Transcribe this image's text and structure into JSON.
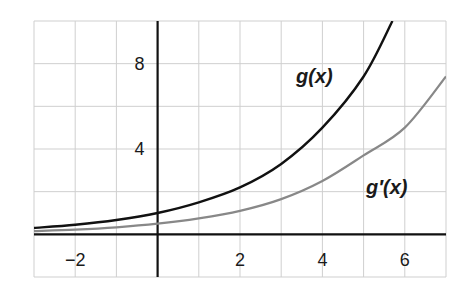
{
  "chart_data": {
    "type": "line",
    "title": "",
    "xlabel": "",
    "ylabel": "",
    "xlim": [
      -3,
      7
    ],
    "ylim": [
      -2,
      10
    ],
    "grid": true,
    "x_grid_step": 1,
    "y_grid_step": 2,
    "x_ticks": [
      -2,
      2,
      4,
      6
    ],
    "x_tick_labels": [
      "−2",
      "2",
      "4",
      "6"
    ],
    "y_ticks": [
      4,
      8
    ],
    "y_tick_labels": [
      "4",
      "8"
    ],
    "series": [
      {
        "name": "g(x)",
        "color": "#111111",
        "label": "g(x)",
        "x": [
          -3,
          -2,
          -1,
          0,
          1,
          2,
          3,
          4,
          5,
          5.7
        ],
        "y": [
          0.3,
          0.45,
          0.67,
          1.0,
          1.5,
          2.2,
          3.3,
          5.0,
          7.4,
          10.0
        ]
      },
      {
        "name": "g'(x)",
        "color": "#888888",
        "label": "g′(x)",
        "x": [
          -3,
          -2,
          -1,
          0,
          1,
          2,
          3,
          4,
          5,
          6,
          7
        ],
        "y": [
          0.15,
          0.22,
          0.33,
          0.5,
          0.75,
          1.1,
          1.65,
          2.5,
          3.7,
          5.0,
          7.4
        ]
      }
    ],
    "annotations": [
      {
        "text": "g(x)",
        "x": 3.4,
        "y": 7.5
      },
      {
        "text": "g′(x)",
        "x": 5.2,
        "y": 2.1
      }
    ]
  },
  "labels": {
    "g": "g(x)",
    "gprime": "g′(x)"
  }
}
